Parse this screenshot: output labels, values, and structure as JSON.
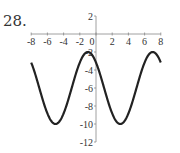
{
  "problem_number": "28.",
  "chart_data": {
    "type": "line",
    "title": "",
    "xlabel": "",
    "ylabel": "",
    "xlim": [
      -8,
      8
    ],
    "ylim": [
      -12,
      2
    ],
    "x_ticks": [
      -8,
      -6,
      -4,
      -2,
      0,
      2,
      4,
      6,
      8
    ],
    "y_ticks": [
      2,
      -2,
      -4,
      -6,
      -8,
      -10,
      -12
    ],
    "x_tick_labels": [
      "-8",
      "-6",
      "-4",
      "-2",
      "0",
      "2",
      "4",
      "6",
      "8"
    ],
    "y_tick_labels": [
      "2",
      "-2",
      "-4",
      "-6",
      "-8",
      "-10",
      "-12"
    ],
    "grid": false,
    "legend": null,
    "series": [
      {
        "name": "y = -6 + 4cos(π(x+1)/4)",
        "x": [
          -8,
          -7,
          -6,
          -5,
          -4,
          -3,
          -2,
          -1,
          0,
          1,
          2,
          3,
          4,
          5,
          6,
          7,
          8
        ],
        "values": [
          -3.17,
          -2.0,
          -3.17,
          -6.0,
          -8.83,
          -10.0,
          -8.83,
          -6.0,
          -3.17,
          -2.0,
          -3.17,
          -6.0,
          -8.83,
          -10.0,
          -8.83,
          -6.0,
          -3.17
        ],
        "note": "values listed shifted: maxima y=-2 at x=-1 and x=7; minima y=-10 at x=-5 and x=3"
      }
    ],
    "key_points": {
      "maxima": [
        [
          -1,
          -2
        ],
        [
          7,
          -2
        ]
      ],
      "minima": [
        [
          -5,
          -10
        ],
        [
          3,
          -10
        ]
      ],
      "endpoints": [
        [
          -8,
          -3.17
        ],
        [
          8,
          -3.17
        ]
      ]
    }
  }
}
